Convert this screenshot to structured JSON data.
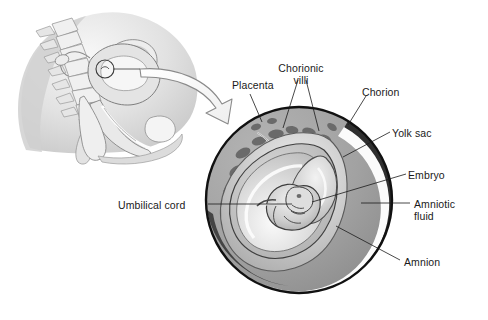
{
  "figure": {
    "background_color": "#ffffff",
    "line_color": "#1a1a1a",
    "text_color": "#1a1a1a"
  },
  "inset": {
    "name": "sagittal-pelvis-section",
    "description": "Midsagittal section of the female pelvis showing the uterus with implantation site circled",
    "palette": {
      "outline": "#6e6e6e",
      "tissue_light": "#ededed",
      "tissue_mid": "#cfcfcf",
      "tissue_dark": "#a8a8a8",
      "highlight": "#fbfbfb"
    }
  },
  "arrow": {
    "name": "magnification-arrow",
    "style": "hollow-curved",
    "fill": "#fdfdfd",
    "stroke": "#8a8a8a"
  },
  "circle": {
    "name": "magnified-cross-section",
    "center_x": 299,
    "center_y": 200,
    "radius": 94,
    "rim_color": "#111111",
    "palette": {
      "decidua": "#a3a3a3",
      "chorion_dark": "#3a3a3a",
      "chorion_white": "#fdfdfd",
      "amniotic_fluid": "#bdbdbd",
      "amnion_line": "#4a4a4a",
      "villi_blob": "#6b6b6b",
      "yolk_sac": "#d9d9d9",
      "embryo": "#c9c9c9"
    }
  },
  "labels": [
    {
      "id": "placenta",
      "name": "label-placenta",
      "text": "Placenta",
      "lines": [
        "Placenta"
      ],
      "x": 232,
      "y": 80,
      "align": "left"
    },
    {
      "id": "chorionic-villi",
      "name": "label-chorionic-villi",
      "text": "Chorionic villi",
      "lines": [
        "Chorionic",
        "villi"
      ],
      "x": 301,
      "y": 63,
      "align": "center"
    },
    {
      "id": "chorion",
      "name": "label-chorion",
      "text": "Chorion",
      "lines": [
        "Chorion"
      ],
      "x": 362,
      "y": 87,
      "align": "left"
    },
    {
      "id": "yolk-sac",
      "name": "label-yolk-sac",
      "text": "Yolk sac",
      "lines": [
        "Yolk sac"
      ],
      "x": 392,
      "y": 128,
      "align": "left"
    },
    {
      "id": "embryo",
      "name": "label-embryo",
      "text": "Embryo",
      "lines": [
        "Embryo"
      ],
      "x": 408,
      "y": 170,
      "align": "left"
    },
    {
      "id": "amniotic-fluid",
      "name": "label-amniotic-fluid",
      "text": "Amniotic fluid",
      "lines": [
        "Amniotic",
        "fluid"
      ],
      "x": 414,
      "y": 199,
      "align": "left"
    },
    {
      "id": "amnion",
      "name": "label-amnion",
      "text": "Amnion",
      "lines": [
        "Amnion"
      ],
      "x": 404,
      "y": 257,
      "align": "left"
    },
    {
      "id": "umbilical-cord",
      "name": "label-umbilical-cord",
      "text": "Umbilical cord",
      "lines": [
        "Umbilical cord"
      ],
      "x": 118,
      "y": 200,
      "align": "left"
    }
  ],
  "leaders": [
    {
      "id": "placenta",
      "name": "leader-placenta",
      "path": "M 250 94 L 262 122"
    },
    {
      "id": "chorionic-villi-a",
      "name": "leader-chorionic-villi-a",
      "path": "M 298 80 L 283 128"
    },
    {
      "id": "chorionic-villi-b",
      "name": "leader-chorionic-villi-b",
      "path": "M 306 80 L 319 131"
    },
    {
      "id": "chorion",
      "name": "leader-chorion",
      "path": "M 366 96 L 348 125"
    },
    {
      "id": "yolk-sac",
      "name": "leader-yolk-sac",
      "path": "M 390 132 L 343 157"
    },
    {
      "id": "embryo",
      "name": "leader-embryo",
      "path": "M 406 174 L 312 202"
    },
    {
      "id": "amniotic-fluid",
      "name": "leader-amniotic-fluid",
      "path": "M 410 203 L 361 203"
    },
    {
      "id": "amnion",
      "name": "leader-amnion",
      "path": "M 400 260 L 336 226"
    },
    {
      "id": "umbilical-cord",
      "name": "leader-umbilical-cord",
      "path": "M 208 204 L 292 204"
    },
    {
      "id": "inset-callout",
      "name": "leader-inset-callout",
      "path": "M 113 69 L 140 69"
    }
  ]
}
